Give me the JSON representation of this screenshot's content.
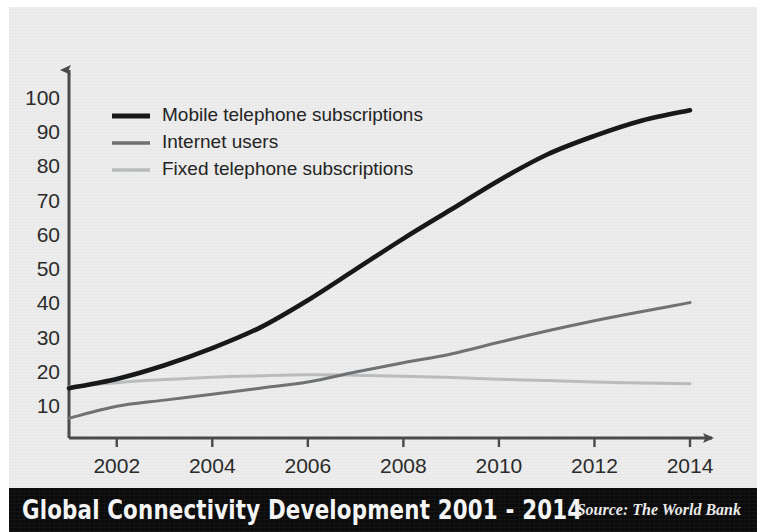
{
  "title": "Global Connectivity Development 2001 - 2014",
  "source": "Source: The World Bank",
  "colors": {
    "background": "#ecedec",
    "page": "#ffffff",
    "titlebar": "#0b0b0c",
    "title_text": "#f4f4f4",
    "axis": "#4a4a4a",
    "tick_text": "#2b2b2b",
    "mobile": "#16181a",
    "internet": "#6f7274",
    "fixed": "#b9bcbd"
  },
  "chart_data": {
    "type": "line",
    "title": "Global Connectivity Development 2001 - 2014",
    "xlabel": "",
    "ylabel": "",
    "xlim": [
      2001,
      2014
    ],
    "ylim": [
      0,
      105
    ],
    "grid": false,
    "legend_position": "top-left",
    "x": [
      2001,
      2002,
      2003,
      2004,
      2005,
      2006,
      2007,
      2008,
      2009,
      2010,
      2011,
      2012,
      2013,
      2014
    ],
    "xticks": [
      2002,
      2004,
      2006,
      2008,
      2010,
      2012,
      2014
    ],
    "xticklabels": [
      "2002",
      "2004",
      "2006",
      "2008",
      "2010",
      "2012",
      "2014"
    ],
    "yticks": [
      10,
      20,
      30,
      40,
      50,
      60,
      70,
      80,
      90,
      100
    ],
    "yticklabels": [
      "10",
      "20",
      "30",
      "40",
      "50",
      "60",
      "70",
      "80",
      "90",
      "100"
    ],
    "series": [
      {
        "name": "Mobile telephone subscriptions",
        "color": "#16181a",
        "width": 4.6,
        "values": [
          15.8,
          18.5,
          22.5,
          27.5,
          33.5,
          41.5,
          50.5,
          59.5,
          68.0,
          76.5,
          84.0,
          89.5,
          94.0,
          97.0
        ]
      },
      {
        "name": "Internet users",
        "color": "#6f7274",
        "width": 3.0,
        "values": [
          7.0,
          10.5,
          12.3,
          14.0,
          15.8,
          17.6,
          20.5,
          23.2,
          25.8,
          29.2,
          32.5,
          35.5,
          38.2,
          40.8
        ]
      },
      {
        "name": "Fixed telephone subscriptions",
        "color": "#b9bcbd",
        "width": 3.0,
        "values": [
          16.2,
          17.4,
          18.3,
          19.0,
          19.4,
          19.7,
          19.6,
          19.3,
          18.9,
          18.4,
          18.0,
          17.6,
          17.3,
          17.1
        ]
      }
    ],
    "annotations": []
  },
  "legend": [
    {
      "label": "Mobile telephone subscriptions"
    },
    {
      "label": "Internet users"
    },
    {
      "label": "Fixed telephone subscriptions"
    }
  ]
}
